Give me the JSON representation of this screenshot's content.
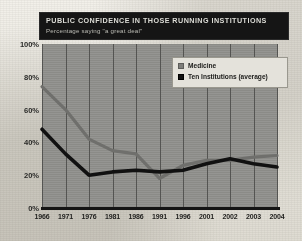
{
  "header": {
    "title": "PUBLIC CONFIDENCE IN THOSE RUNNING INSTITUTIONS",
    "subtitle": "Percentage saying \"a great deal\""
  },
  "legend": {
    "items": [
      {
        "label": "Medicine",
        "color": "#7e7e7b",
        "swatch": "medicine-swatch"
      },
      {
        "label": "Ten Institutions (average)",
        "color": "#111111",
        "swatch": "ten-institutions-swatch"
      }
    ]
  },
  "axes": {
    "y_ticks": [
      "100%",
      "80%",
      "60%",
      "40%",
      "20%",
      "0%"
    ],
    "x_ticks": [
      "1966",
      "1971",
      "1976",
      "1981",
      "1986",
      "1991",
      "1996",
      "2001",
      "2002",
      "2003",
      "2004"
    ]
  },
  "chart_data": {
    "type": "line",
    "title": "PUBLIC CONFIDENCE IN THOSE RUNNING INSTITUTIONS",
    "subtitle": "Percentage saying \"a great deal\"",
    "xlabel": "",
    "ylabel": "",
    "ylim": [
      0,
      100
    ],
    "grid": true,
    "legend_position": "top-right",
    "categories": [
      "1966",
      "1971",
      "1976",
      "1981",
      "1986",
      "1991",
      "1996",
      "2001",
      "2002",
      "2003",
      "2004"
    ],
    "series": [
      {
        "name": "Medicine",
        "color": "#6f6f6c",
        "values": [
          74,
          60,
          42,
          35,
          33,
          18,
          26,
          29,
          29,
          31,
          32
        ]
      },
      {
        "name": "Ten Institutions (average)",
        "color": "#111111",
        "values": [
          48,
          33,
          20,
          22,
          23,
          22,
          23,
          27,
          30,
          27,
          25
        ]
      }
    ]
  }
}
